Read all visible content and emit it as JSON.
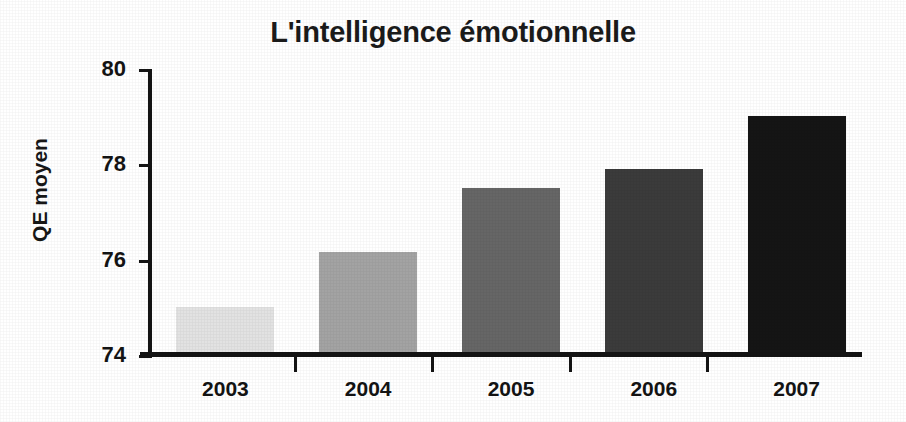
{
  "chart_data": {
    "type": "bar",
    "title": "L'intelligence émotionnelle",
    "xlabel": "",
    "ylabel": "QE moyen",
    "categories": [
      "2003",
      "2004",
      "2005",
      "2006",
      "2007"
    ],
    "values": [
      74.95,
      76.1,
      77.45,
      77.85,
      78.95
    ],
    "series": [
      {
        "name": "QE moyen",
        "values": [
          74.95,
          76.1,
          77.45,
          77.85,
          78.95
        ]
      }
    ],
    "ylim": [
      74,
      80
    ],
    "yticks": [
      "74",
      "76",
      "78",
      "80"
    ],
    "ytick_values": [
      74,
      76,
      78,
      80
    ],
    "grid": false,
    "legend": "none",
    "bar_colors": [
      "#e2e2e2",
      "#a3a3a3",
      "#666666",
      "#3b3b3b",
      "#151515"
    ],
    "axis_color": "#141414",
    "background": "#ffffff"
  }
}
